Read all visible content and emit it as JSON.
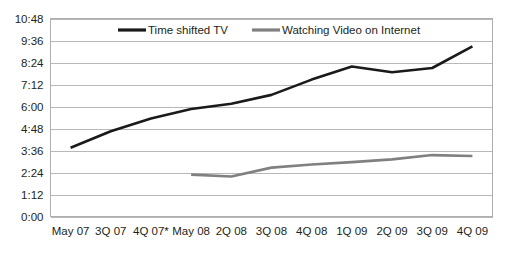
{
  "chart_data": {
    "type": "line",
    "title": "",
    "subtitle": "",
    "xlabel": "",
    "ylabel": "",
    "grid": true,
    "legend_position": "top-inside",
    "categories": [
      "May 07",
      "3Q 07",
      "4Q 07*",
      "May 08",
      "2Q 08",
      "3Q 08",
      "4Q 08",
      "1Q 09",
      "2Q 09",
      "3Q 09",
      "4Q 09"
    ],
    "ytick_labels": [
      "10:48",
      "9:36",
      "8:24",
      "7:12",
      "6:00",
      "4:48",
      "3:36",
      "2:24",
      "1:12",
      "0:00"
    ],
    "ytick_values": [
      648,
      576,
      504,
      432,
      360,
      288,
      216,
      144,
      72,
      0
    ],
    "ylim": [
      0,
      648
    ],
    "y_unit": "hours:minutes",
    "series": [
      {
        "name": "Time shifted TV",
        "color": "#1a1a1a",
        "stroke_width": 2.6,
        "labels": [
          "3:45",
          "4:39",
          "5:21",
          "5:52",
          "6:09",
          "6:38",
          "7:28",
          "8:11",
          "7:52",
          "8:06",
          "9:17"
        ],
        "values": [
          225,
          279,
          321,
          352,
          369,
          398,
          448,
          491,
          472,
          486,
          557
        ]
      },
      {
        "name": "Watching Video on Internet",
        "color": "#808080",
        "stroke_width": 2.6,
        "labels": [
          "",
          "",
          "",
          "2:17",
          "2:11",
          "2:40",
          "2:50",
          "2:58",
          "3:07",
          "3:21",
          "3:18"
        ],
        "values": [
          null,
          null,
          null,
          137,
          131,
          160,
          170,
          178,
          187,
          201,
          198
        ]
      }
    ]
  },
  "legend": {
    "items": [
      {
        "label": "Time shifted TV",
        "color": "#1a1a1a"
      },
      {
        "label": "Watching Video on Internet",
        "color": "#808080"
      }
    ]
  }
}
